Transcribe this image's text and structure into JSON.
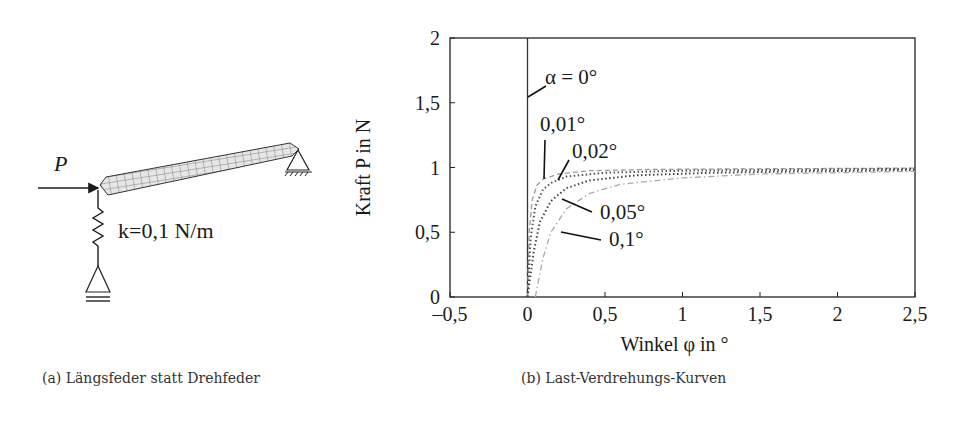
{
  "figure_a": {
    "caption": "(a) Längsfeder statt Drehfeder",
    "force_label": "P",
    "spring_label": "k=0,1 N/m"
  },
  "figure_b": {
    "caption": "(b) Last-Verdrehungs-Kurven"
  },
  "chart_data": {
    "type": "line",
    "title": "",
    "xlabel": "Winkel φ in °",
    "ylabel": "Kraft P in N",
    "xlim": [
      -0.5,
      2.5
    ],
    "ylim": [
      0,
      2
    ],
    "xticks": [
      -0.5,
      0,
      0.5,
      1,
      1.5,
      2,
      2.5
    ],
    "xtick_labels": [
      "–0,5",
      "0",
      "0,5",
      "1",
      "1,5",
      "2",
      "2,5"
    ],
    "yticks": [
      0,
      0.5,
      1,
      1.5,
      2
    ],
    "ytick_labels": [
      "0",
      "0,5",
      "1",
      "1,5",
      "2"
    ],
    "grid": false,
    "series": [
      {
        "name": "α = 0°",
        "alpha": 0,
        "style": "solid",
        "color": "#333333",
        "x": [
          0,
          0
        ],
        "y": [
          0,
          2
        ]
      },
      {
        "name": "0,01°",
        "alpha": 0.01,
        "style": "dashed",
        "color": "#999999",
        "x": [
          0.0,
          0.01,
          0.03,
          0.06,
          0.1,
          0.2,
          0.4,
          0.8,
          1.5,
          2.5
        ],
        "y": [
          0,
          0.5,
          0.75,
          0.86,
          0.91,
          0.95,
          0.975,
          0.985,
          0.99,
          0.995
        ]
      },
      {
        "name": "0,02°",
        "alpha": 0.02,
        "style": "dotted",
        "color": "#555555",
        "x": [
          0.0,
          0.02,
          0.05,
          0.1,
          0.15,
          0.25,
          0.5,
          1.0,
          1.5,
          2.5
        ],
        "y": [
          0,
          0.45,
          0.7,
          0.83,
          0.88,
          0.93,
          0.96,
          0.975,
          0.98,
          0.99
        ]
      },
      {
        "name": "0,05°",
        "alpha": 0.05,
        "style": "dotted",
        "color": "#444444",
        "x": [
          0.0,
          0.04,
          0.08,
          0.15,
          0.25,
          0.4,
          0.7,
          1.2,
          1.8,
          2.5
        ],
        "y": [
          0,
          0.35,
          0.58,
          0.74,
          0.84,
          0.9,
          0.94,
          0.96,
          0.97,
          0.98
        ]
      },
      {
        "name": "0,1°",
        "alpha": 0.1,
        "style": "dashdot",
        "color": "#aaaaaa",
        "x": [
          0.05,
          0.1,
          0.15,
          0.25,
          0.4,
          0.6,
          1.0,
          1.5,
          2.0,
          2.5
        ],
        "y": [
          0,
          0.3,
          0.5,
          0.68,
          0.8,
          0.87,
          0.92,
          0.95,
          0.96,
          0.97
        ]
      }
    ],
    "annotations": [
      {
        "text": "α = 0°",
        "label_x": 545,
        "label_y": 84,
        "line": [
          [
            528,
            97
          ],
          [
            546,
            86
          ]
        ]
      },
      {
        "text": "0,01°",
        "label_x": 540,
        "label_y": 131,
        "line": [
          [
            545,
            140
          ],
          [
            544,
            179
          ]
        ]
      },
      {
        "text": "0,02°",
        "label_x": 572,
        "label_y": 158,
        "line": [
          [
            569,
            160
          ],
          [
            558,
            180
          ]
        ]
      },
      {
        "text": "0,05°",
        "label_x": 600,
        "label_y": 219,
        "line": [
          [
            562,
            199
          ],
          [
            592,
            212
          ]
        ]
      },
      {
        "text": "0,1°",
        "label_x": 609,
        "label_y": 246,
        "line": [
          [
            561,
            232
          ],
          [
            601,
            240
          ]
        ]
      }
    ]
  }
}
